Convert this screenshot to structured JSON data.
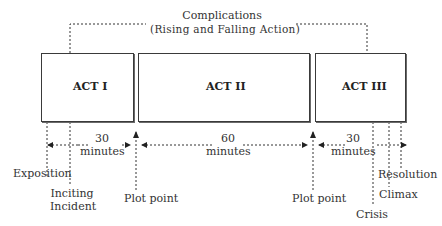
{
  "diagram": {
    "complications": {
      "line1": "Complications",
      "line2": "(Rising and Falling Action)"
    },
    "acts": [
      {
        "label": "ACT I"
      },
      {
        "label": "ACT II"
      },
      {
        "label": "ACT III"
      }
    ],
    "durations": [
      {
        "value": "30",
        "unit": "minutes"
      },
      {
        "value": "60",
        "unit": "minutes"
      },
      {
        "value": "30",
        "unit": "minutes"
      }
    ],
    "markers": {
      "exposition": "Exposition",
      "inciting_1": "Inciting",
      "inciting_2": "Incident",
      "plot_point_1": "Plot point",
      "plot_point_2": "Plot point",
      "crisis": "Crisis",
      "climax": "Climax",
      "resolution": "Resolution"
    }
  }
}
